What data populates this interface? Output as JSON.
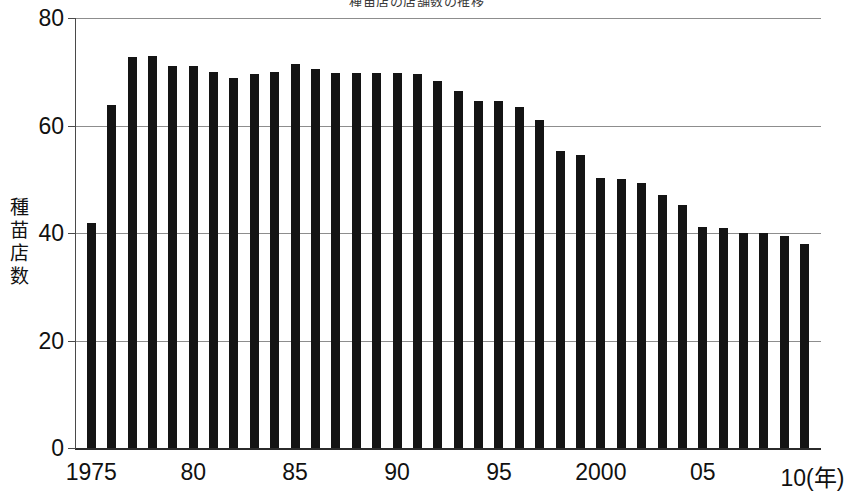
{
  "chart_data": {
    "type": "bar",
    "title": "種苗店の店舗数の推移",
    "title_clipped": true,
    "xlabel": "(年)",
    "ylabel": "種苗店数",
    "ylabel_chars": [
      "種",
      "苗",
      "店",
      "数"
    ],
    "xlim": [
      1974.2,
      2010.8
    ],
    "ylim": [
      0,
      80
    ],
    "yticks": [
      0,
      20,
      40,
      60,
      80
    ],
    "ytick_labels": [
      "0",
      "20",
      "40",
      "60",
      "80"
    ],
    "xticks": [
      1975,
      1980,
      1985,
      1990,
      1995,
      2000,
      2005,
      2010
    ],
    "xtick_labels": [
      "1975",
      "80",
      "85",
      "90",
      "95",
      "2000",
      "05",
      "10"
    ],
    "x_unit_label": "(年)",
    "grid": true,
    "grid_axis": "y",
    "legend": false,
    "bar_color": "#141414",
    "categories": [
      1975,
      1976,
      1977,
      1978,
      1979,
      1980,
      1981,
      1982,
      1983,
      1984,
      1985,
      1986,
      1987,
      1988,
      1989,
      1990,
      1991,
      1992,
      1993,
      1994,
      1995,
      1996,
      1997,
      1998,
      1999,
      2000,
      2001,
      2002,
      2003,
      2004,
      2005,
      2006,
      2007,
      2008,
      2009,
      2010
    ],
    "values": [
      41.8,
      63.8,
      72.8,
      73.0,
      71.0,
      71.0,
      70.0,
      68.8,
      69.5,
      70.0,
      71.5,
      70.5,
      69.8,
      69.8,
      69.8,
      69.8,
      69.5,
      68.3,
      66.5,
      64.5,
      64.5,
      63.5,
      61.0,
      55.3,
      54.5,
      50.3,
      50.0,
      49.3,
      47.0,
      45.2,
      41.2,
      41.0,
      40.0,
      40.0,
      39.5,
      38.0
    ]
  }
}
